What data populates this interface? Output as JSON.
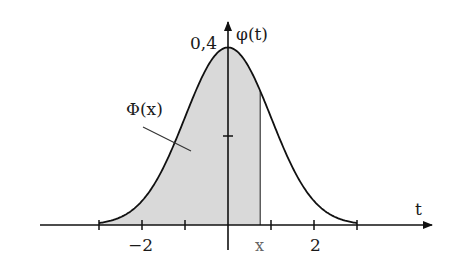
{
  "chart_data": {
    "type": "area",
    "title": "",
    "function": "φ(t) = (1/√(2π))·exp(−t²/2)",
    "xlabel": "t",
    "ylabel": "φ(t)",
    "xlim": [
      -4.4,
      4.7
    ],
    "ylim": [
      0,
      0.45
    ],
    "curve_domain": [
      -3,
      3
    ],
    "x_ticks": [
      -2,
      -1,
      1,
      2
    ],
    "x_tick_labels": [
      {
        "value": -2,
        "label": "−2"
      },
      {
        "value": 2,
        "label": "2"
      }
    ],
    "y_ticks": [
      0.2,
      0.4
    ],
    "y_tick_labels": [
      {
        "value": 0.4,
        "label": "0,4"
      }
    ],
    "shaded_region": {
      "from": -3,
      "to": 0.75,
      "label": "Φ(x)",
      "fill": "#d9d9d9"
    },
    "marker": {
      "value": 0.75,
      "label": "x"
    },
    "x": [
      -3,
      -2.5,
      -2,
      -1.5,
      -1,
      -0.5,
      0,
      0.5,
      1,
      1.5,
      2,
      2.5,
      3
    ],
    "values": [
      0.0044,
      0.0175,
      0.054,
      0.1295,
      0.242,
      0.3521,
      0.3989,
      0.3521,
      0.242,
      0.1295,
      0.054,
      0.0175,
      0.0044
    ],
    "grid": false,
    "legend": null
  },
  "labels": {
    "y_axis_title": "φ(t)",
    "x_axis_title": "t",
    "peak_value": "0,4",
    "area_label": "Φ(x)",
    "x_marker": "x",
    "tick_minus2": "−2",
    "tick_2": "2"
  },
  "colors": {
    "line": "#111111",
    "shade": "#d6d6d6",
    "axis": "#111111",
    "marker_text": "#666666"
  },
  "layout": {
    "origin_px": [
      228,
      225
    ],
    "unit_x_px": 43,
    "unit_y_px_per_0_1": 44.5
  }
}
